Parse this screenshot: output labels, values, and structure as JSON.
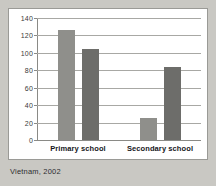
{
  "caption": "Vietnam, 2002",
  "colors": {
    "page_background": "#c9c8c3",
    "panel_background": "#ffffff",
    "panel_border": "#9a9a96",
    "gridline": "#a8a8a4",
    "axis": "#8a8a86",
    "series_light": "#8f8f8b",
    "series_dark": "#6d6d6a",
    "tick_text": "#3a3a38",
    "category_text": "#15161a",
    "caption_text": "#2c2d30"
  },
  "chart_data": {
    "type": "bar",
    "title": "",
    "subtitle": "",
    "xlabel": "",
    "ylabel": "",
    "categories": [
      "Primary school",
      "Secondary school"
    ],
    "series": [
      {
        "name": "series-1",
        "color": "#8f8f8b",
        "values": [
          127.5,
          26
        ]
      },
      {
        "name": "series-2",
        "color": "#6d6d6a",
        "values": [
          105,
          85
        ]
      }
    ],
    "ylim": [
      0,
      140
    ],
    "yticks": [
      0,
      20,
      40,
      60,
      80,
      100,
      120,
      140
    ],
    "ytick_labels": [
      "0",
      "20",
      "40",
      "60",
      "80",
      "100",
      "120",
      "140"
    ],
    "grid": true,
    "grid_axis": "y",
    "legend": false,
    "legend_position": "none",
    "annotations": [
      "Vietnam, 2002"
    ]
  }
}
